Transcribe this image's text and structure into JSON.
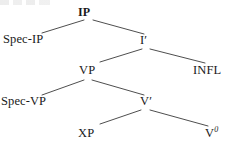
{
  "diagram": {
    "type": "syntax-tree",
    "background_color": "#ffffff",
    "line_color": "#3a3a3a",
    "text_color": "#1a1a1a",
    "nodes": {
      "ip": "IP",
      "spec_ip": "Spec-IP",
      "i_bar_letter": "I",
      "i_bar_prime": "′",
      "vp": "VP",
      "infl": "INFL",
      "spec_vp": "Spec-VP",
      "v_bar_letter": "V",
      "v_bar_prime": "′",
      "xp": "XP",
      "v_zero_letter": "V",
      "v_zero_sup": "0"
    },
    "node_list": [
      {
        "id": "ip",
        "label": "IP",
        "level": 0,
        "x": 88,
        "y": 14
      },
      {
        "id": "spec-ip",
        "label": "Spec-IP",
        "level": 1,
        "x": 31,
        "y": 41
      },
      {
        "id": "i-bar",
        "label": "I′",
        "level": 1,
        "x": 145,
        "y": 42
      },
      {
        "id": "vp",
        "label": "VP",
        "level": 2,
        "x": 88,
        "y": 72
      },
      {
        "id": "infl",
        "label": "INFL",
        "level": 2,
        "x": 210,
        "y": 72
      },
      {
        "id": "spec-vp",
        "label": "Spec-VP",
        "level": 3,
        "x": 31,
        "y": 103
      },
      {
        "id": "v-bar",
        "label": "V′",
        "level": 3,
        "x": 145,
        "y": 103
      },
      {
        "id": "xp",
        "label": "XP",
        "level": 4,
        "x": 88,
        "y": 135
      },
      {
        "id": "v-zero",
        "label": "V⁰",
        "level": 4,
        "x": 212,
        "y": 134
      }
    ],
    "edges": [
      {
        "id": "ip-to-spec-ip",
        "from": "ip",
        "to": "spec-ip",
        "x1": 84,
        "y1": 20,
        "x2": 42,
        "y2": 33
      },
      {
        "id": "ip-to-i-bar",
        "from": "ip",
        "to": "i-bar",
        "x1": 93,
        "y1": 20,
        "x2": 144,
        "y2": 34
      },
      {
        "id": "i-bar-to-vp",
        "from": "i-bar",
        "to": "vp",
        "x1": 142,
        "y1": 49,
        "x2": 100,
        "y2": 62
      },
      {
        "id": "i-bar-to-infl",
        "from": "i-bar",
        "to": "infl",
        "x1": 150,
        "y1": 49,
        "x2": 205,
        "y2": 63
      },
      {
        "id": "vp-to-spec-vp",
        "from": "vp",
        "to": "spec-vp",
        "x1": 84,
        "y1": 80,
        "x2": 42,
        "y2": 95
      },
      {
        "id": "vp-to-v-bar",
        "from": "vp",
        "to": "v-bar",
        "x1": 92,
        "y1": 80,
        "x2": 144,
        "y2": 95
      },
      {
        "id": "v-bar-to-xp",
        "from": "v-bar",
        "to": "xp",
        "x1": 141,
        "y1": 110,
        "x2": 100,
        "y2": 124
      },
      {
        "id": "v-bar-to-v-zero",
        "from": "v-bar",
        "to": "v-zero",
        "x1": 150,
        "y1": 110,
        "x2": 208,
        "y2": 126
      }
    ]
  }
}
